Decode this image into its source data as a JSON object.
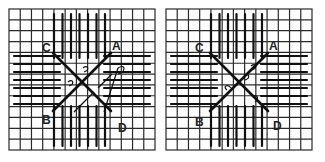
{
  "figure": {
    "panels": [
      {
        "id": "left",
        "labels": {
          "A": "A",
          "B": "B",
          "C": "C",
          "D": "D"
        },
        "note": "Shows thread path with couching loops and return stitch from A toward D"
      },
      {
        "id": "right",
        "labels": {
          "A": "A",
          "B": "B",
          "C": "C",
          "D": "D"
        },
        "note": "Completed cross with couched intersection"
      }
    ],
    "colors": {
      "ink": "#1a1a1a",
      "background": "#ffffff",
      "grid": "#2a2a2a"
    }
  }
}
